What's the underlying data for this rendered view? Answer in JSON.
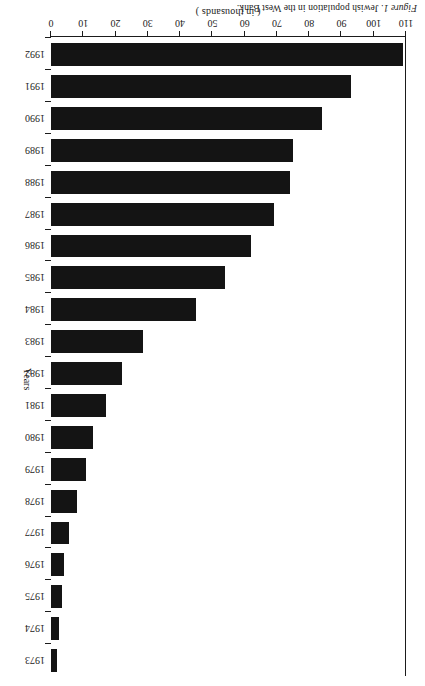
{
  "caption": {
    "figure_label": "Figure 1",
    "text": ". Jewish population in the West Bank."
  },
  "chart_data": {
    "type": "bar",
    "orientation": "horizontal",
    "title": "Figure 1. Jewish population in the West Bank.",
    "xlabel": "( in thousands )",
    "ylabel": "Years",
    "xlim": [
      0,
      110
    ],
    "xticks": [
      0,
      10,
      20,
      30,
      40,
      50,
      60,
      70,
      80,
      90,
      100,
      110
    ],
    "grid": false,
    "legend": false,
    "bar_color": "#141414",
    "categories": [
      "1973",
      "1974",
      "1975",
      "1976",
      "1977",
      "1978",
      "1979",
      "1980",
      "1981",
      "1982",
      "1983",
      "1984",
      "1985",
      "1986",
      "1987",
      "1988",
      "1989",
      "1990",
      "1991",
      "1992"
    ],
    "values": [
      2,
      2.5,
      3.5,
      4,
      5.5,
      8,
      11,
      13,
      17,
      22,
      28.5,
      45,
      54,
      62,
      69,
      74,
      75,
      84,
      93,
      109
    ]
  },
  "axis": {
    "value_title": "( in thousands )",
    "category_title": "Years"
  }
}
